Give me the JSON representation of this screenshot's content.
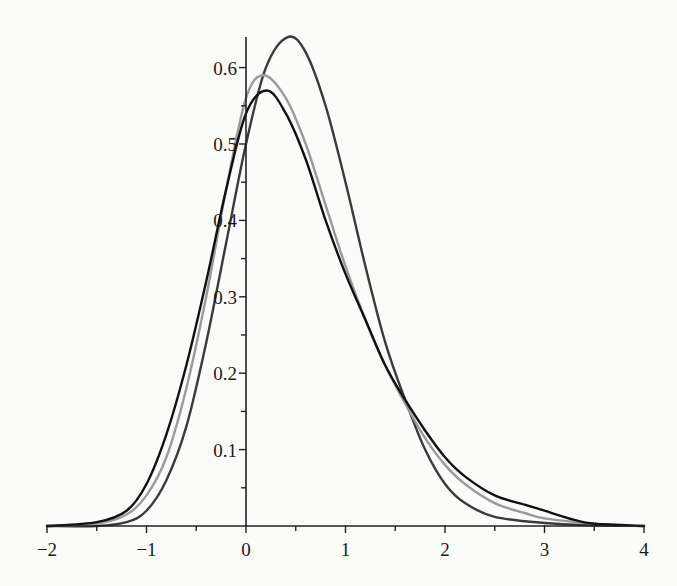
{
  "chart_data": {
    "type": "line",
    "title": "",
    "xlabel": "",
    "ylabel": "",
    "xlim": [
      -2,
      4
    ],
    "ylim": [
      0,
      0.64
    ],
    "grid": false,
    "legend": null,
    "x_ticks": [
      -2,
      -1,
      0,
      1,
      2,
      3,
      4
    ],
    "x_tick_labels": [
      "−2",
      "−1",
      "0",
      "1",
      "2",
      "3",
      "4"
    ],
    "x_minor_ticks": [
      -1.5,
      -0.5,
      0.5,
      1.5,
      2.5,
      3.5
    ],
    "y_ticks": [
      0.1,
      0.2,
      0.3,
      0.4,
      0.5,
      0.6
    ],
    "y_tick_labels": [
      "0.1",
      "0.2",
      "0.3",
      "0.4",
      "0.5",
      "0.6"
    ],
    "y_minor_ticks": [
      0.05,
      0.15,
      0.25,
      0.35,
      0.45,
      0.55
    ],
    "series": [
      {
        "name": "curve-dark-gray-tallest",
        "color": "#3a3a3a",
        "x": [
          -2.0,
          -1.5,
          -1.2,
          -1.0,
          -0.8,
          -0.6,
          -0.4,
          -0.2,
          0.0,
          0.2,
          0.42,
          0.6,
          0.8,
          1.0,
          1.2,
          1.4,
          1.6,
          1.8,
          2.0,
          2.2,
          2.5,
          3.0,
          3.5,
          4.0
        ],
        "y": [
          0.0,
          0.0,
          0.005,
          0.02,
          0.06,
          0.13,
          0.24,
          0.37,
          0.5,
          0.6,
          0.64,
          0.62,
          0.55,
          0.45,
          0.34,
          0.24,
          0.165,
          0.1,
          0.055,
          0.03,
          0.012,
          0.004,
          0.001,
          0.0
        ]
      },
      {
        "name": "curve-light-gray",
        "color": "#9a9a9a",
        "x": [
          -2.0,
          -1.5,
          -1.2,
          -1.0,
          -0.8,
          -0.6,
          -0.4,
          -0.2,
          0.0,
          0.18,
          0.4,
          0.6,
          0.8,
          1.0,
          1.2,
          1.4,
          1.6,
          1.8,
          2.0,
          2.2,
          2.5,
          2.8,
          3.0,
          3.5,
          4.0
        ],
        "y": [
          0.0,
          0.003,
          0.015,
          0.04,
          0.09,
          0.18,
          0.3,
          0.44,
          0.56,
          0.59,
          0.56,
          0.5,
          0.42,
          0.34,
          0.27,
          0.21,
          0.16,
          0.115,
          0.08,
          0.055,
          0.03,
          0.017,
          0.01,
          0.003,
          0.0
        ]
      },
      {
        "name": "curve-black",
        "color": "#111111",
        "x": [
          -2.0,
          -1.5,
          -1.2,
          -1.0,
          -0.8,
          -0.6,
          -0.4,
          -0.2,
          0.0,
          0.21,
          0.4,
          0.6,
          0.8,
          1.0,
          1.2,
          1.4,
          1.6,
          1.8,
          2.0,
          2.2,
          2.5,
          2.8,
          3.0,
          3.3,
          3.5,
          4.0
        ],
        "y": [
          0.0,
          0.005,
          0.02,
          0.055,
          0.12,
          0.21,
          0.32,
          0.44,
          0.54,
          0.57,
          0.54,
          0.48,
          0.4,
          0.33,
          0.27,
          0.21,
          0.165,
          0.125,
          0.09,
          0.065,
          0.04,
          0.028,
          0.02,
          0.008,
          0.003,
          0.0
        ]
      }
    ]
  }
}
